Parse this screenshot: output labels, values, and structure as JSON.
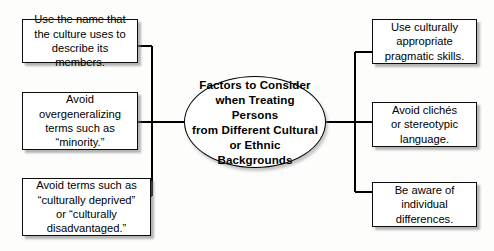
{
  "diagram": {
    "title": "Factors to Consider when Treating Persons from Different Cultural or Ethnic Backgrounds",
    "center": {
      "label": "Factors to Consider\nwhen Treating Persons\nfrom Different Cultural\nor Ethnic Backgrounds"
    },
    "left_nodes": [
      {
        "label": "Use the name that\nthe culture uses to\ndescribe its members."
      },
      {
        "label": "Avoid\novergeneralizing\nterms such as\n“minority.”"
      },
      {
        "label": "Avoid terms such as\n“culturally deprived”\nor “culturally\ndisadvantaged.”"
      }
    ],
    "right_nodes": [
      {
        "label": "Use culturally\nappropriate\npragmatic skills."
      },
      {
        "label": "Avoid clichés\nor stereotypic\nlanguage."
      },
      {
        "label": "Be aware of\nindividual\ndifferences."
      }
    ],
    "colors": {
      "background": "#fdfdfc",
      "node_fill": "#ffffff",
      "node_border": "#0d0d0d",
      "connector": "#000000",
      "shadow": "#9a9a9a",
      "text": "#000000"
    }
  }
}
